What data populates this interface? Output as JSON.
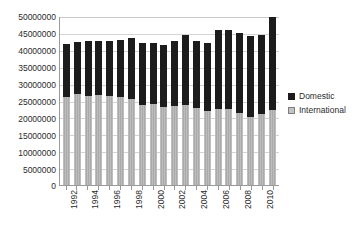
{
  "chart_data": {
    "type": "bar",
    "stacked": true,
    "title": "",
    "subtitle": "",
    "xlabel": "",
    "ylabel": "",
    "ylim": [
      0,
      50000000
    ],
    "ytick_step": 5000000,
    "ytick_labels": [
      "50000000",
      "45000000",
      "40000000",
      "35000000",
      "30000000",
      "25000000",
      "20000000",
      "15000000",
      "10000000",
      "5000000",
      "0"
    ],
    "grid": true,
    "grid_axis": "y",
    "legend_position": "right",
    "categories": [
      "1992",
      "1993",
      "1994",
      "1995",
      "1996",
      "1997",
      "1998",
      "1999",
      "2000",
      "2001",
      "2002",
      "2003",
      "2004",
      "2005",
      "2006",
      "2007",
      "2008",
      "2009",
      "2010",
      "2011"
    ],
    "xtick_labels_shown": [
      "1992",
      "1994",
      "1996",
      "1998",
      "2000",
      "2002",
      "2004",
      "2006",
      "2008",
      "2010"
    ],
    "series": [
      {
        "name": "International",
        "color": "#b0b0b0",
        "values": [
          26100000,
          26800000,
          26400000,
          26600000,
          26300000,
          26000000,
          25400000,
          23700000,
          23900000,
          23100000,
          23300000,
          23800000,
          22700000,
          21800000,
          22400000,
          22600000,
          21300000,
          20100000,
          21000000,
          22200000
        ]
      },
      {
        "name": "Domestic",
        "color": "#1c1c1c",
        "values": [
          15600000,
          15400000,
          16300000,
          16000000,
          16200000,
          16800000,
          18000000,
          18400000,
          18200000,
          18400000,
          19300000,
          20500000,
          19800000,
          20300000,
          23400000,
          23300000,
          23700000,
          24100000,
          23300000,
          27700000
        ]
      }
    ],
    "totals": [
      41700000,
      42200000,
      42700000,
      42600000,
      42500000,
      42800000,
      43400000,
      42100000,
      42100000,
      41500000,
      42600000,
      44300000,
      42500000,
      42100000,
      45800000,
      45900000,
      45000000,
      44200000,
      44300000,
      49900000
    ]
  },
  "legend": {
    "items": [
      {
        "label": "Domestic",
        "swatch": "domestic-swatch"
      },
      {
        "label": "International",
        "swatch": "international-swatch"
      }
    ]
  }
}
